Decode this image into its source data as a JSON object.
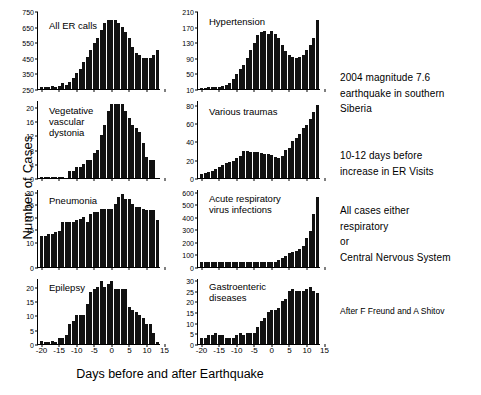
{
  "figure": {
    "xlabel": "Days before and after Earthquake",
    "ylabel": "Number of Cases",
    "credit": "After F Freund and A Shitov"
  },
  "notes": [
    "2004 magnitude 7.6\nearthquake in southern\nSiberia",
    "10-12 days before\nincrease in ER Visits",
    "All cases either\nrespiratory\nor\nCentral Nervous System"
  ],
  "chart_data": [
    {
      "type": "bar",
      "title": "All ER calls",
      "xlabel": "Days before and after Earthquake",
      "ylabel": "Number of Cases",
      "ylim": [
        250,
        750
      ],
      "yticks": [
        250,
        350,
        450,
        550,
        650,
        750
      ],
      "xlim": [
        -21,
        14
      ],
      "xticks": [
        -20,
        -15,
        -10,
        -5,
        0,
        5,
        10,
        15
      ],
      "grid": false,
      "x": [
        -20,
        -19,
        -18,
        -17,
        -16,
        -15,
        -14,
        -13,
        -12,
        -11,
        -10,
        -9,
        -8,
        -7,
        -6,
        -5,
        -4,
        -3,
        -2,
        -1,
        0,
        1,
        2,
        3,
        4,
        5,
        6,
        7,
        8,
        9,
        10,
        11,
        12,
        13
      ],
      "values": [
        262,
        263,
        262,
        268,
        266,
        272,
        286,
        278,
        295,
        320,
        352,
        380,
        420,
        455,
        500,
        545,
        580,
        630,
        670,
        690,
        690,
        690,
        670,
        650,
        615,
        575,
        520,
        480,
        465,
        450,
        450,
        452,
        470,
        500
      ]
    },
    {
      "type": "bar",
      "title": "Hypertension",
      "xlabel": "Days before and after Earthquake",
      "ylabel": "Number of Cases",
      "ylim": [
        10,
        210
      ],
      "yticks": [
        10,
        50,
        90,
        130,
        170,
        210
      ],
      "xlim": [
        -21,
        14
      ],
      "xticks": [
        -20,
        -15,
        -10,
        -5,
        0,
        5,
        10,
        15
      ],
      "grid": false,
      "x": [
        -20,
        -19,
        -18,
        -17,
        -16,
        -15,
        -14,
        -13,
        -12,
        -11,
        -10,
        -9,
        -8,
        -7,
        -6,
        -5,
        -4,
        -3,
        -2,
        -1,
        0,
        1,
        2,
        3,
        4,
        5,
        6,
        7,
        8,
        9,
        10,
        11,
        12,
        13
      ],
      "values": [
        13,
        13,
        14,
        14,
        15,
        16,
        18,
        20,
        26,
        36,
        48,
        62,
        72,
        90,
        110,
        128,
        148,
        155,
        160,
        152,
        158,
        152,
        140,
        124,
        108,
        96,
        92,
        90,
        92,
        98,
        110,
        122,
        140,
        188
      ]
    },
    {
      "type": "bar",
      "title": "Vegetative\nvascular\ndystonia",
      "xlabel": "Days before and after Earthquake",
      "ylabel": "Number of Cases",
      "ylim": [
        0,
        22
      ],
      "yticks": [
        0,
        4,
        8,
        12,
        16,
        20
      ],
      "xlim": [
        -21,
        14
      ],
      "xticks": [
        -20,
        -15,
        -10,
        -5,
        0,
        5,
        10,
        15
      ],
      "grid": false,
      "x": [
        -20,
        -19,
        -18,
        -17,
        -16,
        -15,
        -14,
        -13,
        -12,
        -11,
        -10,
        -9,
        -8,
        -7,
        -6,
        -5,
        -4,
        -3,
        -2,
        -1,
        0,
        1,
        2,
        3,
        4,
        5,
        6,
        7,
        8,
        9,
        10,
        11,
        12,
        13
      ],
      "values": [
        0.4,
        0.4,
        0.4,
        0.4,
        0.4,
        0.4,
        0.4,
        0,
        2,
        2,
        3,
        3,
        4,
        5,
        5,
        7,
        8,
        12,
        15,
        19,
        21,
        21,
        21,
        21,
        19,
        17,
        15,
        14,
        13,
        10,
        6,
        5,
        5,
        0
      ]
    },
    {
      "type": "bar",
      "title": "Various traumas",
      "xlabel": "Days before and after Earthquake",
      "ylabel": "Number of Cases",
      "ylim": [
        0,
        85
      ],
      "yticks": [
        0,
        20,
        40,
        60,
        80
      ],
      "xlim": [
        -21,
        14
      ],
      "xticks": [
        -20,
        -15,
        -10,
        -5,
        0,
        5,
        10,
        15
      ],
      "grid": false,
      "x": [
        -20,
        -19,
        -18,
        -17,
        -16,
        -15,
        -14,
        -13,
        -12,
        -11,
        -10,
        -9,
        -8,
        -7,
        -6,
        -5,
        -4,
        -3,
        -2,
        -1,
        0,
        1,
        2,
        3,
        4,
        5,
        6,
        7,
        8,
        9,
        10,
        11,
        12,
        13
      ],
      "values": [
        4,
        5,
        7,
        8,
        10,
        12,
        14,
        16,
        17,
        19,
        22,
        24,
        29,
        29,
        28,
        28,
        28,
        27,
        26,
        26,
        25,
        23,
        22,
        24,
        30,
        33,
        40,
        44,
        48,
        54,
        58,
        64,
        72,
        80
      ]
    },
    {
      "type": "bar",
      "title": "Pneumonia",
      "xlabel": "Days before and after Earthquake",
      "ylabel": "Number of Cases",
      "ylim": [
        0,
        31
      ],
      "yticks": [
        0,
        10,
        15,
        20,
        25,
        30
      ],
      "xlim": [
        -21,
        14
      ],
      "xticks": [
        -20,
        -15,
        -10,
        -5,
        0,
        5,
        10,
        15
      ],
      "grid": false,
      "x": [
        -20,
        -19,
        -18,
        -17,
        -16,
        -15,
        -14,
        -13,
        -12,
        -11,
        -10,
        -9,
        -8,
        -7,
        -6,
        -5,
        -4,
        -3,
        -2,
        -1,
        0,
        1,
        2,
        3,
        4,
        5,
        6,
        7,
        8,
        9,
        10,
        11,
        12,
        13
      ],
      "values": [
        12.5,
        12.5,
        13,
        13,
        14,
        14.5,
        18,
        18,
        18,
        18,
        18.5,
        19,
        20,
        18,
        21,
        22,
        22,
        23,
        23,
        23,
        23,
        25,
        28,
        29,
        27,
        27,
        25,
        24,
        24,
        23,
        22.5,
        22.5,
        22.5,
        18.5
      ]
    },
    {
      "type": "bar",
      "title": "Acute respiratory\nvirus infections",
      "xlabel": "Days before and after Earthquake",
      "ylabel": "Number of Cases",
      "ylim": [
        0,
        620
      ],
      "yticks": [
        0,
        100,
        200,
        300,
        400,
        500,
        600
      ],
      "xlim": [
        -21,
        14
      ],
      "xticks": [
        -20,
        -15,
        -10,
        -5,
        0,
        5,
        10,
        15
      ],
      "grid": false,
      "x": [
        -20,
        -19,
        -18,
        -17,
        -16,
        -15,
        -14,
        -13,
        -12,
        -11,
        -10,
        -9,
        -8,
        -7,
        -6,
        -5,
        -4,
        -3,
        -2,
        -1,
        0,
        1,
        2,
        3,
        4,
        5,
        6,
        7,
        8,
        9,
        10,
        11,
        12,
        13
      ],
      "values": [
        38,
        38,
        36,
        38,
        36,
        38,
        36,
        38,
        36,
        38,
        36,
        38,
        36,
        38,
        36,
        38,
        36,
        38,
        36,
        38,
        36,
        42,
        56,
        68,
        86,
        108,
        118,
        130,
        140,
        168,
        230,
        290,
        420,
        560
      ]
    },
    {
      "type": "bar",
      "title": "Epilepsy",
      "xlabel": "Days before and after Earthquake",
      "ylabel": "Number of Cases",
      "ylim": [
        0,
        23
      ],
      "yticks": [
        0,
        5,
        10,
        15,
        20
      ],
      "xlim": [
        -21,
        14
      ],
      "xticks": [
        -20,
        -15,
        -10,
        -5,
        0,
        5,
        10,
        15
      ],
      "grid": false,
      "x": [
        -20,
        -19,
        -18,
        -17,
        -16,
        -15,
        -14,
        -13,
        -12,
        -11,
        -10,
        -9,
        -8,
        -7,
        -6,
        -5,
        -4,
        -3,
        -2,
        -1,
        0,
        1,
        2,
        3,
        4,
        5,
        6,
        7,
        8,
        9,
        10,
        11,
        12,
        13
      ],
      "values": [
        1,
        0.6,
        0.6,
        1,
        0.6,
        2,
        2,
        3,
        7,
        8,
        10,
        10,
        10,
        14,
        18,
        19,
        20,
        22,
        20,
        21,
        22,
        19,
        19,
        19,
        19,
        13,
        12,
        11,
        10,
        9,
        7,
        7,
        4,
        0.6
      ]
    },
    {
      "type": "bar",
      "title": "Gastroenteric\ndiseases",
      "xlabel": "Days before and after Earthquake",
      "ylabel": "Number of Cases",
      "ylim": [
        0,
        31
      ],
      "yticks": [
        0,
        5,
        10,
        15,
        20,
        25,
        30
      ],
      "xlim": [
        -21,
        14
      ],
      "xticks": [
        -20,
        -15,
        -10,
        -5,
        0,
        5,
        10,
        15
      ],
      "grid": false,
      "x": [
        -20,
        -19,
        -18,
        -17,
        -16,
        -15,
        -14,
        -13,
        -12,
        -11,
        -10,
        -9,
        -8,
        -7,
        -6,
        -5,
        -4,
        -3,
        -2,
        -1,
        0,
        1,
        2,
        3,
        4,
        5,
        6,
        7,
        8,
        9,
        10,
        11,
        12,
        13
      ],
      "values": [
        3,
        3,
        4,
        4,
        5,
        4,
        4,
        3,
        3,
        3,
        4,
        5,
        4,
        5,
        5,
        5,
        8,
        11,
        12,
        15,
        16,
        16,
        17,
        20,
        21,
        25,
        26,
        25,
        25,
        25,
        26,
        27,
        25,
        24
      ]
    }
  ]
}
